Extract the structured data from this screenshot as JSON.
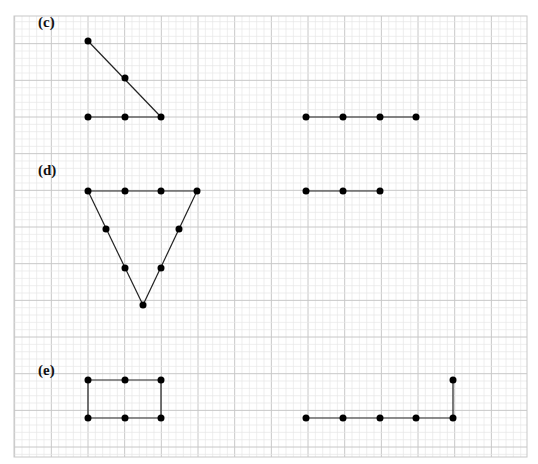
{
  "grid": {
    "left": 14,
    "top": 16,
    "right": 527,
    "bottom": 457,
    "major_spacing": 36.67,
    "minor_per_major": 5,
    "major_color": "#c8c8c8",
    "minor_color": "#e6e6e6"
  },
  "style": {
    "line_color": "#222222",
    "dot_color": "#000000",
    "dot_radius": 3.5
  },
  "parts": [
    {
      "id": "c",
      "label": "(c)",
      "label_pos": [
        38,
        27
      ],
      "left_figure": {
        "points": [
          [
            88,
            41
          ],
          [
            125,
            78
          ],
          [
            161,
            117
          ],
          [
            88,
            117
          ],
          [
            125,
            117
          ]
        ],
        "segments": [
          [
            [
              88,
              41
            ],
            [
              161,
              117
            ]
          ],
          [
            [
              88,
              117
            ],
            [
              161,
              117
            ]
          ]
        ]
      },
      "right_figure": {
        "points": [
          [
            306,
            117
          ],
          [
            343,
            117
          ],
          [
            380,
            117
          ],
          [
            416,
            117
          ]
        ],
        "segments": [
          [
            [
              306,
              117
            ],
            [
              416,
              117
            ]
          ]
        ]
      }
    },
    {
      "id": "d",
      "label": "(d)",
      "label_pos": [
        38,
        175
      ],
      "left_figure": {
        "points": [
          [
            88,
            191
          ],
          [
            125,
            191
          ],
          [
            161,
            191
          ],
          [
            197,
            191
          ],
          [
            106,
            229
          ],
          [
            179,
            229
          ],
          [
            125,
            268
          ],
          [
            161,
            268
          ],
          [
            143,
            305
          ]
        ],
        "segments": [
          [
            [
              88,
              191
            ],
            [
              197,
              191
            ]
          ],
          [
            [
              88,
              191
            ],
            [
              143,
              305
            ]
          ],
          [
            [
              197,
              191
            ],
            [
              143,
              305
            ]
          ]
        ]
      },
      "right_figure": {
        "points": [
          [
            306,
            191
          ],
          [
            343,
            191
          ],
          [
            380,
            191
          ]
        ],
        "segments": [
          [
            [
              306,
              191
            ],
            [
              380,
              191
            ]
          ]
        ]
      }
    },
    {
      "id": "e",
      "label": "(e)",
      "label_pos": [
        38,
        375
      ],
      "left_figure": {
        "points": [
          [
            88,
            380
          ],
          [
            125,
            380
          ],
          [
            161,
            380
          ],
          [
            88,
            418
          ],
          [
            125,
            418
          ],
          [
            161,
            418
          ]
        ],
        "segments": [
          [
            [
              88,
              380
            ],
            [
              161,
              380
            ]
          ],
          [
            [
              88,
              418
            ],
            [
              161,
              418
            ]
          ],
          [
            [
              88,
              380
            ],
            [
              88,
              418
            ]
          ],
          [
            [
              161,
              380
            ],
            [
              161,
              418
            ]
          ]
        ]
      },
      "right_figure": {
        "points": [
          [
            306,
            418
          ],
          [
            343,
            418
          ],
          [
            380,
            418
          ],
          [
            416,
            418
          ],
          [
            453,
            418
          ],
          [
            453,
            380
          ]
        ],
        "segments": [
          [
            [
              306,
              418
            ],
            [
              453,
              418
            ]
          ],
          [
            [
              453,
              418
            ],
            [
              453,
              380
            ]
          ]
        ]
      }
    }
  ]
}
